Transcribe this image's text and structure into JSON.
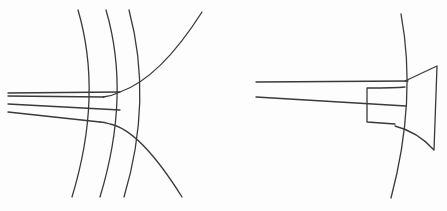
{
  "figure": {
    "description": "Two-panel line drawing: left panel shows concentric arcs crossed by converging channel lines with curved branches; right panel shows a channel entering a flared bell-shaped outlet at a large arc.",
    "line_color": "#3a3a3a",
    "background": "#fdfdfd",
    "panels": [
      {
        "id": "left",
        "elements": [
          "arc-1",
          "arc-2",
          "arc-3",
          "upper-branch-curve",
          "lower-branch-curve",
          "channel-line-double",
          "channel-line-middle",
          "channel-line-lower"
        ]
      },
      {
        "id": "right",
        "elements": [
          "boundary-arc",
          "channel-upper-line",
          "channel-lower-line",
          "flared-outlet",
          "inner-rect"
        ]
      }
    ]
  }
}
